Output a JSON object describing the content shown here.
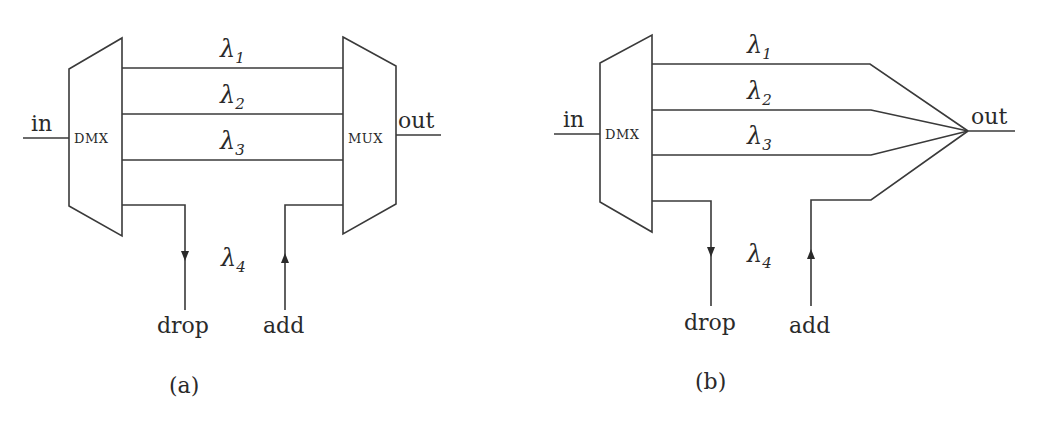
{
  "panels": [
    {
      "id": "a",
      "caption": "(a)",
      "input_label": "in",
      "output_label": "out",
      "demux_label": "DMX",
      "mux_label": "MUX",
      "channels": [
        {
          "symbol": "λ",
          "index": "1"
        },
        {
          "symbol": "λ",
          "index": "2"
        },
        {
          "symbol": "λ",
          "index": "3"
        }
      ],
      "dropped_channel": {
        "symbol": "λ",
        "index": "4"
      },
      "drop_label": "drop",
      "add_label": "add"
    },
    {
      "id": "b",
      "caption": "(b)",
      "input_label": "in",
      "output_label": "out",
      "demux_label": "DMX",
      "channels": [
        {
          "symbol": "λ",
          "index": "1"
        },
        {
          "symbol": "λ",
          "index": "2"
        },
        {
          "symbol": "λ",
          "index": "3"
        }
      ],
      "dropped_channel": {
        "symbol": "λ",
        "index": "4"
      },
      "drop_label": "drop",
      "add_label": "add"
    }
  ],
  "colors": {
    "line": "#3a3a3a",
    "text": "#2a2a2a",
    "background": "#ffffff"
  }
}
